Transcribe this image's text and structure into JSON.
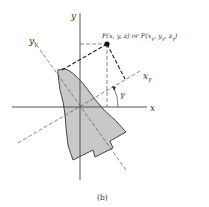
{
  "figure": {
    "caption": "(b)",
    "axes": {
      "x_label": "x",
      "y_label": "y",
      "x_gamma_label": "x",
      "x_gamma_sub": "γ",
      "y_gamma_label": "y",
      "y_gamma_sub": "γ"
    },
    "angle_label": "γ",
    "point_label": "P(x, y, z) or P(x",
    "point_label_parts": {
      "prefix": "P(x, y, z) or P(x",
      "sub1": "γ",
      "mid1": ", y",
      "sub2": "γ",
      "mid2": ", z",
      "sub3": "γ",
      "suffix": ")"
    },
    "colors": {
      "shape_fill": "#c8c8c8",
      "line": "#333333"
    }
  }
}
